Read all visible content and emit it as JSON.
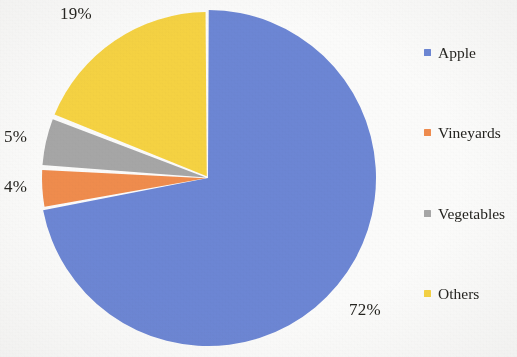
{
  "chart_data": {
    "type": "pie",
    "title": "",
    "categories": [
      "Apple",
      "Vineyards",
      "Vegetables",
      "Others"
    ],
    "values": [
      72,
      4,
      5,
      19
    ],
    "value_labels": [
      "72%",
      "4%",
      "5%",
      "19%"
    ],
    "unit": "%",
    "colors": [
      "#6C86D4",
      "#EF8C4E",
      "#A6A6A6",
      "#F5D243"
    ],
    "legend_position": "right",
    "grid": false,
    "start_angle_deg": 0,
    "direction": "clockwise",
    "slice_gap": true,
    "labels_outside": true
  },
  "legend": {
    "items": [
      {
        "label": "Apple",
        "color": "#6C86D4"
      },
      {
        "label": "Vineyards",
        "color": "#EF8C4E"
      },
      {
        "label": "Vegetables",
        "color": "#A6A6A6"
      },
      {
        "label": "Others",
        "color": "#F5D243"
      }
    ]
  },
  "pie_labels": {
    "others": "19%",
    "vegetables": "5%",
    "vineyards": "4%",
    "apple": "72%"
  }
}
